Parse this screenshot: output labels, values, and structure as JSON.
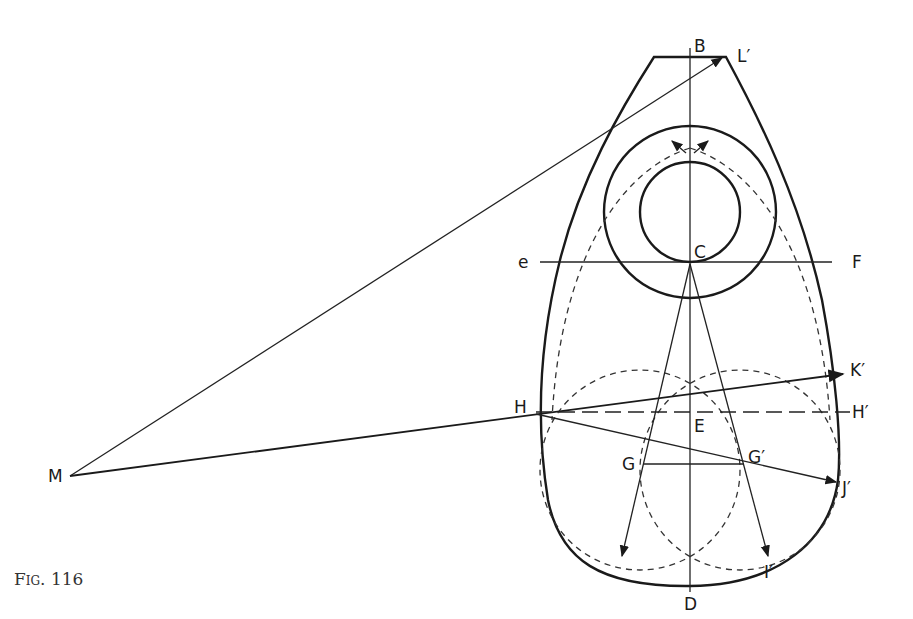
{
  "figure": {
    "caption": "Fig. 116",
    "labels": {
      "B": "B",
      "L_prime": "L′",
      "C": "C",
      "e": "e",
      "F": "F",
      "K_prime": "K′",
      "H": "H",
      "H_prime": "H′",
      "E": "E",
      "G": "G",
      "G_prime": "G′",
      "J_prime": "J′",
      "M": "M",
      "D": "D",
      "I_prime": "I′"
    },
    "colors": {
      "ink": "#1a1a1a",
      "background": "#ffffff"
    }
  }
}
